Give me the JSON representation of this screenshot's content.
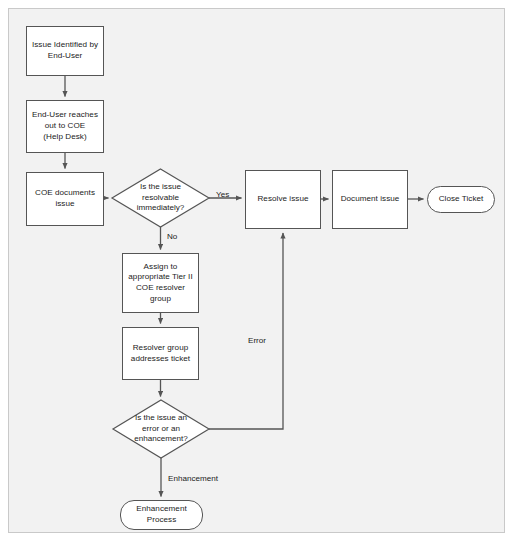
{
  "diagram": {
    "background_color": "#f2f2f2",
    "canvas_border_color": "#c9c9c9",
    "node_fill_color": "#ffffff",
    "node_border_color": "#555555",
    "connector_color": "#555555",
    "text_color": "#1b1b1b",
    "nodes": [
      {
        "id": "issue-identified",
        "shape": "process",
        "label": "Issue Identified by\nEnd-User",
        "x": 26,
        "y": 26,
        "w": 78,
        "h": 50
      },
      {
        "id": "end-user-reaches-out",
        "shape": "process",
        "label": "End-User reaches\nout to COE\n(Help Desk)",
        "x": 26,
        "y": 100,
        "w": 78,
        "h": 53
      },
      {
        "id": "coe-documents-issue",
        "shape": "process",
        "label": "COE documents\nissue",
        "x": 26,
        "y": 172,
        "w": 78,
        "h": 54
      },
      {
        "id": "is-issue-resolvable",
        "shape": "decision",
        "label": "Is the issue\nresolvable\nimmediately?",
        "x": 112,
        "y": 169,
        "w": 97,
        "h": 58
      },
      {
        "id": "resolve-issue",
        "shape": "process",
        "label": "Resolve issue",
        "x": 245,
        "y": 170,
        "w": 76,
        "h": 59
      },
      {
        "id": "document-issue",
        "shape": "process",
        "label": "Document issue",
        "x": 332,
        "y": 170,
        "w": 76,
        "h": 59
      },
      {
        "id": "close-ticket",
        "shape": "terminator",
        "label": "Close Ticket",
        "x": 427,
        "y": 186,
        "w": 68,
        "h": 27
      },
      {
        "id": "assign-to-tier-ii",
        "shape": "process",
        "label": "Assign to\nappropriate Tier II\nCOE resolver\ngroup",
        "x": 122,
        "y": 253,
        "w": 77,
        "h": 60
      },
      {
        "id": "resolver-group-addresses",
        "shape": "process",
        "label": "Resolver group\naddresses ticket",
        "x": 122,
        "y": 327,
        "w": 77,
        "h": 53
      },
      {
        "id": "is-issue-error-or-enhancement",
        "shape": "decision",
        "label": "Is the issue an\nerror or an\nenhancement?",
        "x": 113,
        "y": 400,
        "w": 96,
        "h": 58
      },
      {
        "id": "enhancement-process",
        "shape": "terminator",
        "label": "Enhancement\nProcess",
        "x": 120,
        "y": 500,
        "w": 83,
        "h": 30
      }
    ],
    "edge_labels": [
      {
        "id": "yes-label",
        "text": "Yes",
        "x": 216,
        "y": 190
      },
      {
        "id": "no-label",
        "text": "No",
        "x": 167,
        "y": 232
      },
      {
        "id": "error-label",
        "text": "Error",
        "x": 248,
        "y": 336
      },
      {
        "id": "enhancement-label",
        "text": "Enhancement",
        "x": 168,
        "y": 474
      }
    ],
    "connectors": [
      {
        "id": "issue-identified-to-end-user",
        "from": "issue-identified",
        "to": "end-user-reaches-out"
      },
      {
        "id": "end-user-to-coe-documents",
        "from": "end-user-reaches-out",
        "to": "coe-documents-issue"
      },
      {
        "id": "coe-documents-to-decision",
        "from": "coe-documents-issue",
        "to": "is-issue-resolvable"
      },
      {
        "id": "decision-yes-to-resolve",
        "from": "is-issue-resolvable",
        "to": "resolve-issue",
        "label": "Yes"
      },
      {
        "id": "decision-no-to-assign",
        "from": "is-issue-resolvable",
        "to": "assign-to-tier-ii",
        "label": "No"
      },
      {
        "id": "resolve-to-document",
        "from": "resolve-issue",
        "to": "document-issue"
      },
      {
        "id": "document-to-close",
        "from": "document-issue",
        "to": "close-ticket"
      },
      {
        "id": "assign-to-resolver",
        "from": "assign-to-tier-ii",
        "to": "resolver-group-addresses"
      },
      {
        "id": "resolver-to-decision2",
        "from": "resolver-group-addresses",
        "to": "is-issue-error-or-enhancement"
      },
      {
        "id": "decision2-error-to-resolve",
        "from": "is-issue-error-or-enhancement",
        "to": "resolve-issue",
        "label": "Error"
      },
      {
        "id": "decision2-enhancement-to-process",
        "from": "is-issue-error-or-enhancement",
        "to": "enhancement-process",
        "label": "Enhancement"
      }
    ]
  }
}
